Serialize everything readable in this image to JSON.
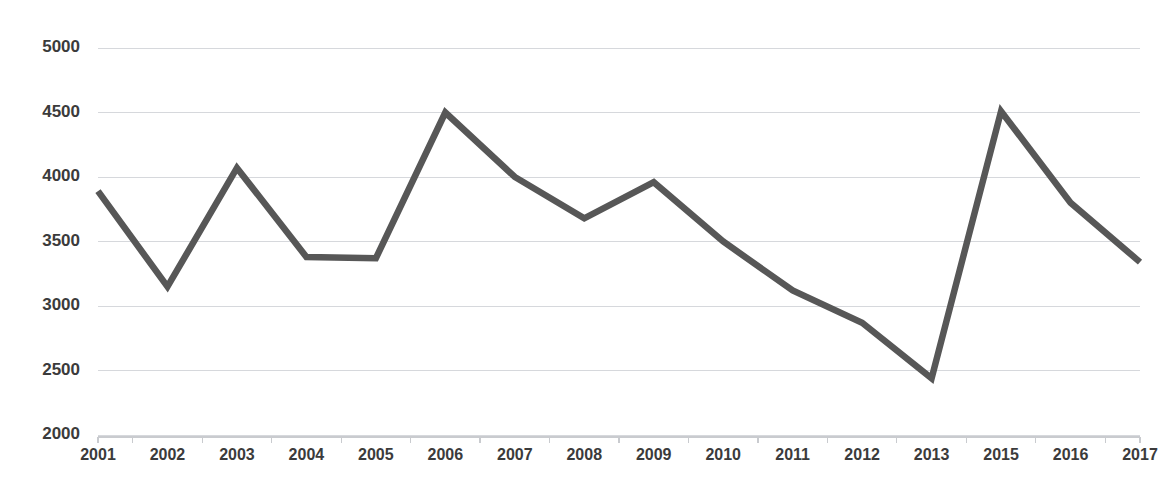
{
  "chart_data": {
    "type": "line",
    "title": "",
    "subtitle": "",
    "xlabel": "",
    "ylabel": "",
    "categories": [
      "2001",
      "2002",
      "2003",
      "2004",
      "2005",
      "2006",
      "2007",
      "2008",
      "2009",
      "2010",
      "2011",
      "2012",
      "2013",
      "2015",
      "2016",
      "2017"
    ],
    "values": [
      3890,
      3150,
      4070,
      3380,
      3370,
      4500,
      4000,
      3680,
      3960,
      3500,
      3120,
      2870,
      2440,
      4510,
      3800,
      3340
    ],
    "series": [
      {
        "name": "series-1",
        "values": [
          3890,
          3150,
          4070,
          3380,
          3370,
          4500,
          4000,
          3680,
          3960,
          3500,
          3120,
          2870,
          2440,
          4510,
          3800,
          3340
        ],
        "color": "#575757"
      }
    ],
    "ylim": [
      2000,
      5000
    ],
    "ytick_labels": [
      "5000",
      "4500",
      "4000",
      "3500",
      "3000",
      "2500",
      "2000"
    ],
    "ytick_values": [
      5000,
      4500,
      4000,
      3500,
      3000,
      2500,
      2000
    ],
    "grid": true,
    "grid_axis": "y",
    "grid_color": "#d6d8dc",
    "legend": false,
    "legend_position": "none",
    "markers": false,
    "background_color": "#ffffff",
    "axis_color": "#c9cbcf",
    "label_color": "#3b3b3b"
  }
}
